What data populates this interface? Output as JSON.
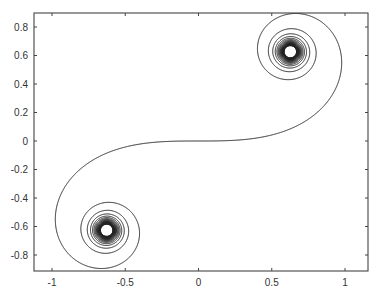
{
  "chart_data": {
    "type": "line",
    "title": "",
    "xlabel": "",
    "ylabel": "",
    "xlim": [
      -1.1,
      1.1
    ],
    "ylim": [
      -0.9,
      0.9
    ],
    "grid": false,
    "legend": "none",
    "x_ticks": [
      -1,
      -0.5,
      0,
      0.5,
      1
    ],
    "x_tick_labels": [
      "-1",
      "-0.5",
      "0",
      "0.5",
      "1"
    ],
    "y_ticks": [
      0.8,
      0.6,
      0.4,
      0.2,
      0,
      -0.2,
      -0.4,
      -0.6,
      -0.8
    ],
    "y_tick_labels": [
      "0.8",
      "0.6",
      "0.4",
      "0.2",
      "0",
      "-0.2",
      "-0.4",
      "-0.6",
      "-0.8"
    ],
    "series": [
      {
        "name": "Euler (Cornu) spiral",
        "description": "x(t)=∫0..t cos(s^2) ds, y(t)=∫0..t sin(s^2) ds",
        "t_range": [
          -12,
          12
        ],
        "limit_points": [
          [
            0.627,
            0.627
          ],
          [
            -0.627,
            -0.627
          ]
        ],
        "color": "#222222"
      }
    ]
  }
}
